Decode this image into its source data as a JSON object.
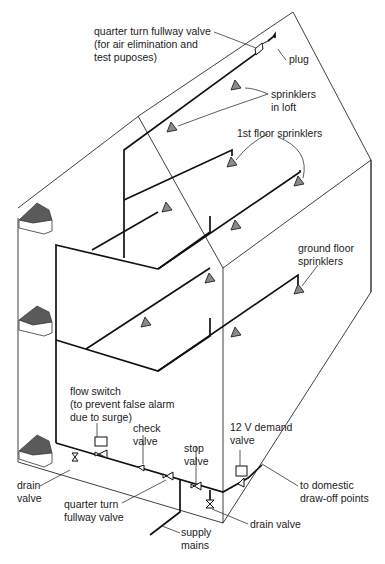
{
  "diagram": {
    "labels": {
      "quarter_turn_top": [
        "quarter turn fullway valve",
        "(for air elimination and",
        "test puposes)"
      ],
      "plug": "plug",
      "sprinklers_loft": [
        "sprinklers",
        "in loft"
      ],
      "first_floor": "1st floor sprinklers",
      "ground_floor": [
        "ground floor",
        "sprinklers"
      ],
      "flow_switch": [
        "flow switch",
        "(to prevent false alarm",
        "due to surge)"
      ],
      "check_valve": [
        "check",
        "valve"
      ],
      "stop_valve": [
        "stop",
        "valve"
      ],
      "demand_valve": [
        "12 V demand",
        "valve"
      ],
      "drain_valve_left": [
        "drain",
        "valve"
      ],
      "quarter_turn_bottom": [
        "quarter turn",
        "fullway valve"
      ],
      "domestic": [
        "to domestic",
        "draw-off points"
      ],
      "drain_valve_right": "drain valve",
      "supply_mains": [
        "supply",
        "mains"
      ]
    },
    "colors": {
      "line": "#222222",
      "sprinkler_fill": "#8a8a8a",
      "roof_fill": "#5a5a5a",
      "background": "#ffffff"
    }
  }
}
